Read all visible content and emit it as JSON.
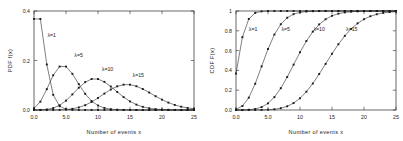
{
  "figure": {
    "title": "",
    "panels": [
      "pdf",
      "cdf"
    ]
  },
  "chart_data": [
    {
      "type": "line",
      "id": "pdf",
      "title": "",
      "xlabel": "Number of events x",
      "ylabel": "PDF f(x)",
      "xlim": [
        0,
        25
      ],
      "ylim": [
        0,
        0.4
      ],
      "grid": false,
      "legend": "inline-annotations",
      "xticks": [
        0,
        5,
        10,
        15,
        20,
        25
      ],
      "xticklabels": [
        "0.0",
        "5.0",
        "10",
        "15",
        "20",
        "25"
      ],
      "yticks": [
        0.0,
        0.2,
        0.4
      ],
      "yticklabels": [
        "0.0",
        "0.2",
        "0.4"
      ],
      "x": [
        0,
        1,
        2,
        3,
        4,
        5,
        6,
        7,
        8,
        9,
        10,
        11,
        12,
        13,
        14,
        15,
        16,
        17,
        18,
        19,
        20,
        21,
        22,
        23,
        24,
        25
      ],
      "series": [
        {
          "name": "λ=1",
          "label": "λ=1",
          "label_x": 2.1,
          "label_y": 0.295,
          "values": [
            0.3679,
            0.3679,
            0.1839,
            0.0613,
            0.0153,
            0.0031,
            0.0005,
            0.0001,
            0.0,
            0.0,
            0.0,
            0.0,
            0.0,
            0.0,
            0.0,
            0.0,
            0.0,
            0.0,
            0.0,
            0.0,
            0.0,
            0.0,
            0.0,
            0.0,
            0.0,
            0.0
          ]
        },
        {
          "name": "λ=5",
          "label": "λ=5",
          "label_x": 6.3,
          "label_y": 0.213,
          "values": [
            0.0067,
            0.0337,
            0.0842,
            0.1404,
            0.1755,
            0.1755,
            0.1462,
            0.1044,
            0.0653,
            0.0363,
            0.0181,
            0.0082,
            0.0034,
            0.0013,
            0.0005,
            0.0002,
            0.0,
            0.0,
            0.0,
            0.0,
            0.0,
            0.0,
            0.0,
            0.0,
            0.0,
            0.0
          ]
        },
        {
          "name": "λ=10",
          "label": "λ=10",
          "label_x": 10.6,
          "label_y": 0.158,
          "values": [
            0.0,
            0.0005,
            0.0023,
            0.0076,
            0.0189,
            0.0378,
            0.0631,
            0.0901,
            0.1126,
            0.1251,
            0.1251,
            0.1137,
            0.0948,
            0.0729,
            0.0521,
            0.0347,
            0.0217,
            0.0128,
            0.0071,
            0.0037,
            0.0019,
            0.0009,
            0.0004,
            0.0002,
            0.0001,
            0.0
          ]
        },
        {
          "name": "λ=15",
          "label": "λ=15",
          "label_x": 15.4,
          "label_y": 0.134,
          "values": [
            0.0,
            0.0,
            0.0,
            0.0002,
            0.0006,
            0.0019,
            0.0048,
            0.0104,
            0.0194,
            0.0324,
            0.0486,
            0.0663,
            0.0829,
            0.0956,
            0.1024,
            0.1024,
            0.096,
            0.0847,
            0.0706,
            0.0557,
            0.0418,
            0.0299,
            0.0204,
            0.0133,
            0.0083,
            0.005
          ]
        }
      ]
    },
    {
      "type": "line",
      "id": "cdf",
      "title": "",
      "xlabel": "Number of events x",
      "ylabel": "CDF F(x)",
      "xlim": [
        0,
        25
      ],
      "ylim": [
        0,
        1
      ],
      "grid": false,
      "legend": "inline-annotations",
      "xticks": [
        0,
        5,
        10,
        15,
        20,
        25
      ],
      "xticklabels": [
        "0.0",
        "5.0",
        "10",
        "15",
        "20",
        "25"
      ],
      "yticks": [
        0.0,
        0.2,
        0.4,
        0.6,
        0.8,
        1.0
      ],
      "yticklabels": [
        "0.0",
        "0.2",
        "0.4",
        "0.6",
        "0.8",
        "1"
      ],
      "x": [
        0,
        1,
        2,
        3,
        4,
        5,
        6,
        7,
        8,
        9,
        10,
        11,
        12,
        13,
        14,
        15,
        16,
        17,
        18,
        19,
        20,
        21,
        22,
        23,
        24,
        25
      ],
      "series": [
        {
          "name": "λ=1",
          "label": "λ=1",
          "label_x": 2.0,
          "label_y": 0.8,
          "values": [
            0.3679,
            0.7358,
            0.9197,
            0.981,
            0.9963,
            0.9994,
            0.9999,
            1.0,
            1.0,
            1.0,
            1.0,
            1.0,
            1.0,
            1.0,
            1.0,
            1.0,
            1.0,
            1.0,
            1.0,
            1.0,
            1.0,
            1.0,
            1.0,
            1.0,
            1.0,
            1.0
          ]
        },
        {
          "name": "λ=5",
          "label": "λ=5",
          "label_x": 7.1,
          "label_y": 0.8,
          "values": [
            0.0067,
            0.0404,
            0.1247,
            0.265,
            0.4405,
            0.616,
            0.7622,
            0.8666,
            0.9319,
            0.9682,
            0.9863,
            0.9945,
            0.998,
            0.9993,
            0.9998,
            0.9999,
            1.0,
            1.0,
            1.0,
            1.0,
            1.0,
            1.0,
            1.0,
            1.0,
            1.0,
            1.0
          ]
        },
        {
          "name": "λ=10",
          "label": "λ=10",
          "label_x": 12.1,
          "label_y": 0.8,
          "values": [
            0.0,
            0.0005,
            0.0028,
            0.0103,
            0.0293,
            0.0671,
            0.1301,
            0.2202,
            0.3328,
            0.4579,
            0.583,
            0.6968,
            0.7916,
            0.8645,
            0.9165,
            0.9513,
            0.973,
            0.9857,
            0.9928,
            0.9965,
            0.9984,
            0.9993,
            0.9997,
            0.9999,
            1.0,
            1.0
          ]
        },
        {
          "name": "λ=15",
          "label": "λ=15",
          "label_x": 17.2,
          "label_y": 0.8,
          "values": [
            0.0,
            0.0,
            0.0,
            0.0002,
            0.0009,
            0.0028,
            0.0076,
            0.018,
            0.0374,
            0.0699,
            0.1185,
            0.1848,
            0.2676,
            0.3632,
            0.4657,
            0.5681,
            0.6641,
            0.7489,
            0.8195,
            0.8752,
            0.917,
            0.9469,
            0.9673,
            0.9805,
            0.9888,
            0.9938
          ]
        }
      ]
    }
  ]
}
